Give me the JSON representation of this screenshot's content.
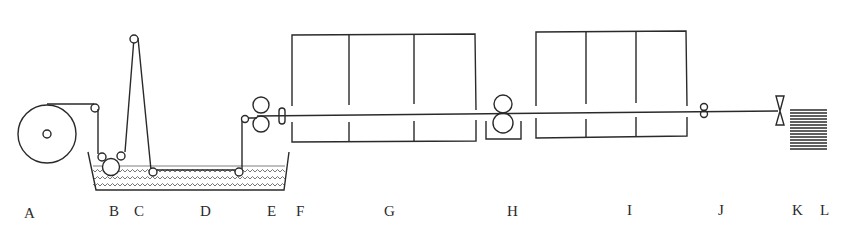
{
  "diagram": {
    "type": "process-flow",
    "ink_color": "#2a2a2a",
    "liquid_pattern": "wavy-hatch",
    "labels": [
      {
        "id": "A",
        "text": "A",
        "x": 26,
        "y": 214
      },
      {
        "id": "B",
        "text": "B",
        "x": 111,
        "y": 211
      },
      {
        "id": "C",
        "text": "C",
        "x": 136,
        "y": 211
      },
      {
        "id": "D",
        "text": "D",
        "x": 200,
        "y": 211
      },
      {
        "id": "E",
        "text": "E",
        "x": 267,
        "y": 211
      },
      {
        "id": "F",
        "text": "F",
        "x": 296,
        "y": 211
      },
      {
        "id": "G",
        "text": "G",
        "x": 384,
        "y": 211
      },
      {
        "id": "H",
        "text": "H",
        "x": 507,
        "y": 211
      },
      {
        "id": "I",
        "text": "I",
        "x": 626,
        "y": 210
      },
      {
        "id": "J",
        "text": "J",
        "x": 719,
        "y": 210
      },
      {
        "id": "K",
        "text": "K",
        "x": 795,
        "y": 210
      },
      {
        "id": "L",
        "text": "L",
        "x": 821,
        "y": 210
      }
    ],
    "components": [
      {
        "id": "A",
        "name": "feed-roll"
      },
      {
        "id": "B",
        "name": "guide-rollers-immersion"
      },
      {
        "id": "C",
        "name": "vertical-loop-roller"
      },
      {
        "id": "D",
        "name": "impregnation-bath"
      },
      {
        "id": "E",
        "name": "squeeze-rolls"
      },
      {
        "id": "F",
        "name": "guide-pins"
      },
      {
        "id": "G",
        "name": "drying-oven-3-zone"
      },
      {
        "id": "H",
        "name": "pull-rolls"
      },
      {
        "id": "I",
        "name": "curing-oven-3-zone"
      },
      {
        "id": "J",
        "name": "tension-rollers"
      },
      {
        "id": "K",
        "name": "cutter"
      },
      {
        "id": "L",
        "name": "stacked-sheets"
      }
    ]
  }
}
